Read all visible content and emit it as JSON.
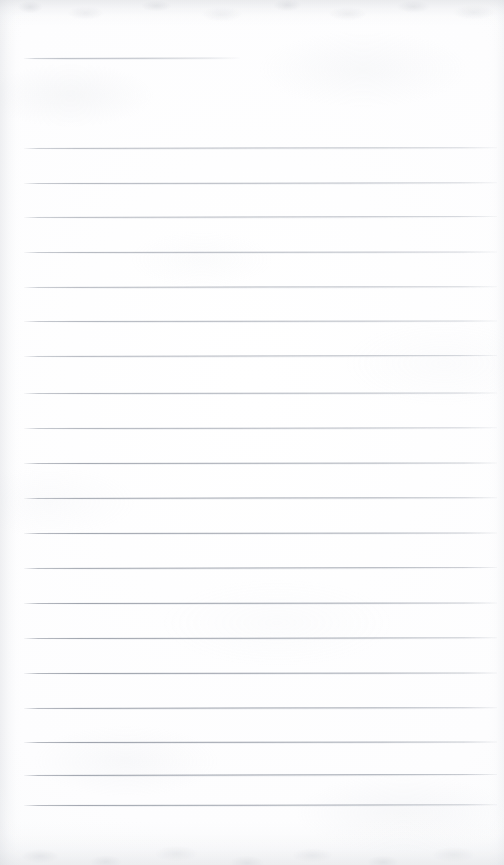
{
  "page": {
    "kind": "scanned-blank-ruled-notebook-page",
    "width": 504,
    "height": 865,
    "paper_color": "#fdfdfe",
    "rule_color": "#a0a5af",
    "rule_color_dark": "#8e949f",
    "edge_shadow_color": "#b0b4bc",
    "text_content": "",
    "visible_text": []
  },
  "header_rule": {
    "label": "",
    "x": 24,
    "y": 58,
    "width": 216,
    "tilt_deg": -0.12
  },
  "ruled_lines": {
    "count": 20,
    "left_x": 24,
    "right_x": 497,
    "first_y": 148,
    "spacing": 34.6,
    "lines": [
      {
        "y": 148,
        "tilt": -0.1,
        "dark": false,
        "opacity": 0.78
      },
      {
        "y": 183,
        "tilt": -0.08,
        "dark": false,
        "opacity": 0.82
      },
      {
        "y": 217,
        "tilt": -0.12,
        "dark": false,
        "opacity": 0.8
      },
      {
        "y": 252,
        "tilt": -0.06,
        "dark": false,
        "opacity": 0.84
      },
      {
        "y": 287,
        "tilt": -0.1,
        "dark": false,
        "opacity": 0.82
      },
      {
        "y": 321,
        "tilt": -0.07,
        "dark": false,
        "opacity": 0.86
      },
      {
        "y": 356,
        "tilt": -0.11,
        "dark": false,
        "opacity": 0.84
      },
      {
        "y": 393,
        "tilt": -0.05,
        "dark": false,
        "opacity": 0.88
      },
      {
        "y": 428,
        "tilt": -0.09,
        "dark": false,
        "opacity": 0.86
      },
      {
        "y": 463,
        "tilt": -0.06,
        "dark": true,
        "opacity": 0.84
      },
      {
        "y": 498,
        "tilt": -0.1,
        "dark": true,
        "opacity": 0.86
      },
      {
        "y": 533,
        "tilt": -0.07,
        "dark": true,
        "opacity": 0.88
      },
      {
        "y": 568,
        "tilt": -0.11,
        "dark": true,
        "opacity": 0.86
      },
      {
        "y": 603,
        "tilt": -0.05,
        "dark": true,
        "opacity": 0.9
      },
      {
        "y": 638,
        "tilt": -0.09,
        "dark": true,
        "opacity": 0.88
      },
      {
        "y": 673,
        "tilt": -0.06,
        "dark": true,
        "opacity": 0.92
      },
      {
        "y": 708,
        "tilt": -0.1,
        "dark": true,
        "opacity": 0.9
      },
      {
        "y": 742,
        "tilt": -0.07,
        "dark": true,
        "opacity": 0.92
      },
      {
        "y": 775,
        "tilt": -0.11,
        "dark": true,
        "opacity": 0.94
      },
      {
        "y": 805,
        "tilt": -0.08,
        "dark": true,
        "opacity": 0.92
      }
    ]
  }
}
